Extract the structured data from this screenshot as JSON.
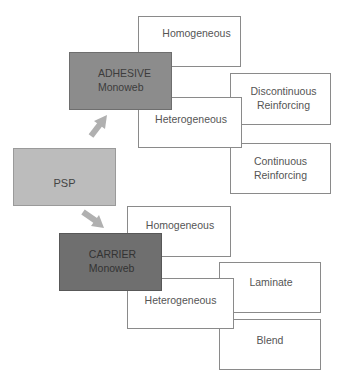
{
  "diagram": {
    "root": {
      "label": "PSP",
      "color": "#bcbcbc"
    },
    "adhesive": {
      "label": "ADHESIVE\nMonoweb",
      "color": "#8c8c8c",
      "homogeneous": "Homogeneous",
      "heterogeneous": "Heterogeneous",
      "discontinuous": "Discontinuous\nReinforcing",
      "continuous": "Continuous\nReinforcing"
    },
    "carrier": {
      "label": "CARRIER\nMonoweb",
      "color": "#6f6f6f",
      "homogeneous": "Homogeneous",
      "heterogeneous": "Heterogeneous",
      "laminate": "Laminate",
      "blend": "Blend"
    },
    "arrow_color": "#b0b0b0"
  }
}
